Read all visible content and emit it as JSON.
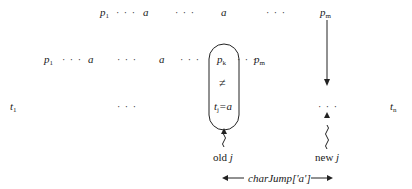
{
  "pattern_top": {
    "p1": "p",
    "p1_sub": "1",
    "a1": "a",
    "a2": "a",
    "pm": "p",
    "pm_sub": "m",
    "dots": "· · ·"
  },
  "pattern_shifted": {
    "p1": "p",
    "p1_sub": "1",
    "a1": "a",
    "a2": "a",
    "pk": "p",
    "pk_sub": "k",
    "pm": "p",
    "pm_sub": "m",
    "dots": "· · ·"
  },
  "text_row": {
    "t1": "t",
    "t1_sub": "1",
    "tn": "t",
    "tn_sub": "n",
    "dots": "· · ·"
  },
  "mismatch_box": {
    "neq": "≠",
    "tj": "t",
    "tj_sub": "j",
    "eq_a": "=a"
  },
  "labels": {
    "old_j": "old",
    "old_j_var": "j",
    "new_j": "new",
    "new_j_var": "j",
    "char_jump": "charJump['a']",
    "left_arrow": "←",
    "right_arrow": "→"
  }
}
